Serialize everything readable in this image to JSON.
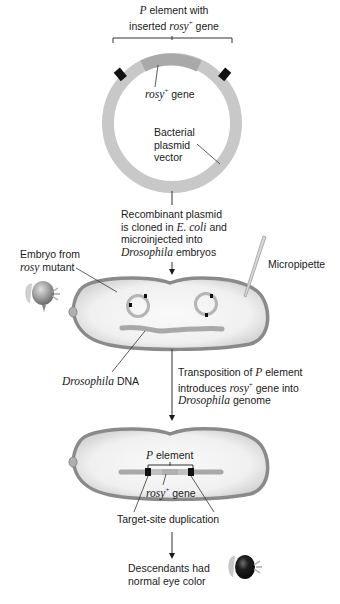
{
  "labels": {
    "p_element_header": {
      "line1_italic": "P",
      "line1_rest": " element with",
      "line2_pre": "inserted ",
      "line2_italic": "rosy",
      "line2_sup": "+",
      "line2_post": " gene"
    },
    "rosy_gene_top": {
      "italic": "rosy",
      "sup": "+",
      "post": " gene"
    },
    "plasmid_vector": {
      "line1": "Bacterial",
      "line2": "plasmid",
      "line3": "vector"
    },
    "step1": {
      "line1": "Recombinant plasmid",
      "line2_pre": "is cloned in ",
      "line2_italic": "E. coli",
      "line2_post": " and",
      "line3": "microinjected into",
      "line4_italic": "Drosophila",
      "line4_post": " embryos"
    },
    "embryo_from": {
      "line1": "Embryo from",
      "line2_italic": "rosy",
      "line2_post": " mutant"
    },
    "micropipette": "Micropipette",
    "drosophila_dna": {
      "italic": "Drosophila",
      "post": " DNA"
    },
    "step2": {
      "line1_pre": "Transposition of ",
      "line1_italic": "P",
      "line1_post": " element",
      "line2_pre": "introduces ",
      "line2_italic": "rosy",
      "line2_sup": "+",
      "line2_post": " gene into",
      "line3_italic": "Drosophila",
      "line3_post": " genome"
    },
    "p_element_bottom": {
      "italic": "P",
      "post": " element"
    },
    "rosy_gene_bottom": {
      "italic": "rosy",
      "sup": "+",
      "post": " gene"
    },
    "target_site": "Target-site duplication",
    "descendants": {
      "line1": "Descendants had",
      "line2": "normal eye color"
    }
  },
  "colors": {
    "plasmid_ring": "#c8c8c8",
    "rosy_segment": "#a9a9a9",
    "marker": "#111111",
    "embryo_outline": "#8a8a8a",
    "embryo_fill": "#ececec",
    "dna_strand": "#a8a8a8",
    "mutant_eye": "#9a9a9a",
    "normal_eye": "#1e1e1e"
  }
}
